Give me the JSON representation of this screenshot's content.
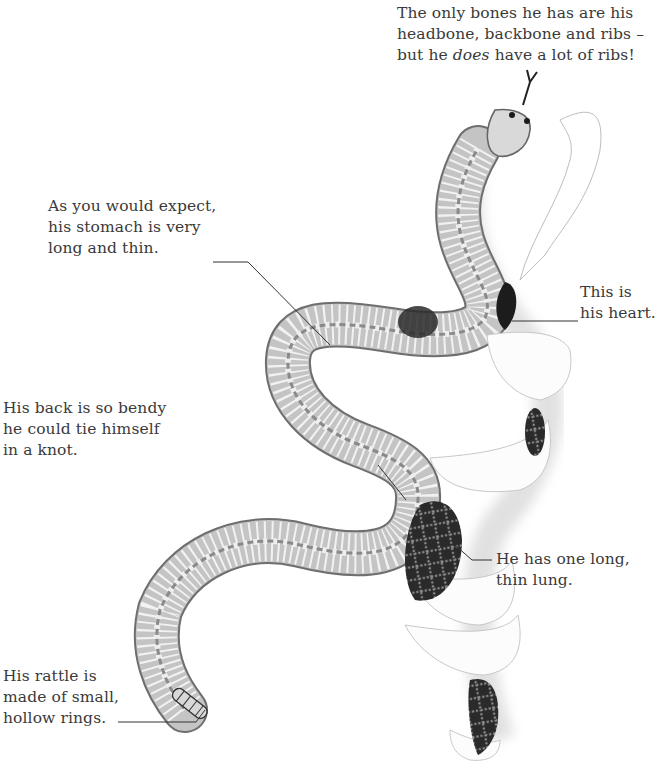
{
  "captions": {
    "bones": {
      "lines": [
        "The only bones he has are his",
        "headbone, backbone and ribs –"
      ],
      "line3_prefix": "but he ",
      "line3_emphasis": "does",
      "line3_suffix": " have a lot of ribs!"
    },
    "stomach": {
      "lines": [
        "As you would expect,",
        "his stomach is very",
        "long and thin."
      ]
    },
    "heart": {
      "lines": [
        "This is",
        "his heart."
      ]
    },
    "back": {
      "lines": [
        "His back is so bendy",
        "he could tie himself",
        "in a knot."
      ]
    },
    "lung": {
      "lines": [
        "He has one long,",
        "thin lung."
      ]
    },
    "rattle": {
      "lines": [
        "His rattle is",
        "made of small,",
        "hollow rings."
      ]
    }
  },
  "illustration": {
    "subject": "snake-anatomy-skeleton",
    "colors": {
      "body_fill": "#b9b9b9",
      "rib_stroke": "#f2f2f2",
      "outline": "#6e6e6e",
      "organ_dark": "#1e1e1e",
      "skin_wrap": "#fbfbfb",
      "text": "#3a3a3a"
    }
  }
}
